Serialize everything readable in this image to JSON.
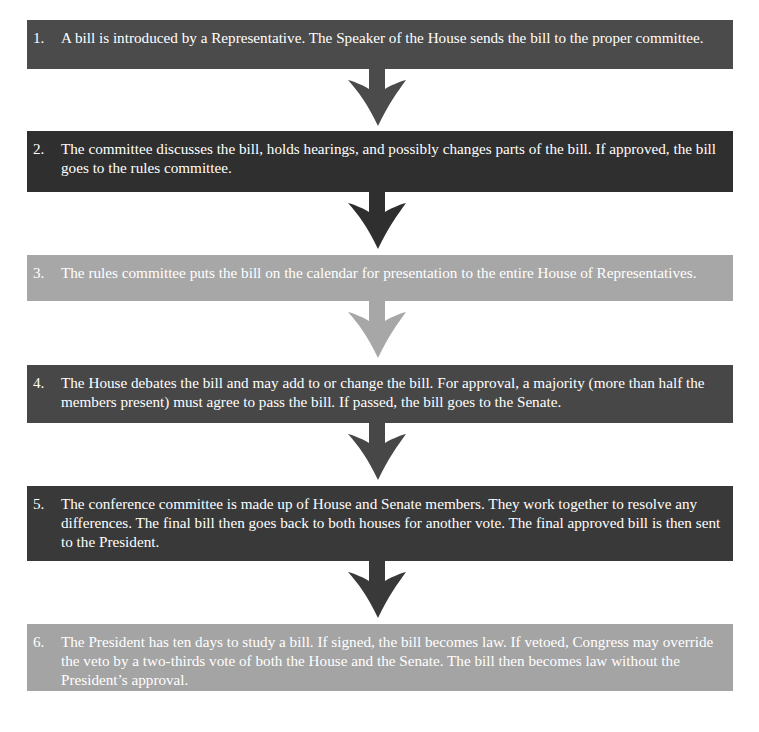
{
  "diagram": {
    "steps": [
      {
        "number": "1.",
        "text": "A bill is introduced by a Representative. The Speaker of the House sends the bill to the proper committee.",
        "color": "#4b4b4b"
      },
      {
        "number": "2.",
        "text": "The committee discusses the bill, holds hearings, and possibly changes parts of the bill. If approved, the bill goes to the rules committee.",
        "color": "#2f2f2f"
      },
      {
        "number": "3.",
        "text": "The rules committee puts the bill on the calendar for presentation to the entire House of Representatives.",
        "color": "#a7a7a7"
      },
      {
        "number": "4.",
        "text": "The House debates the bill and may add to or change the bill. For approval, a majority (more than half the members present) must agree to pass the bill. If passed, the bill goes to the Senate.",
        "color": "#474747"
      },
      {
        "number": "5.",
        "text": "The conference committee is made up of House and Senate members. They work together to resolve any differences. The final bill then goes back to both houses for another vote. The final approved bill is then sent to the President.",
        "color": "#393939"
      },
      {
        "number": "6.",
        "text": "The President has ten days to study a bill. If signed, the bill becomes law. If vetoed, Congress may override the veto by a two-thirds vote of both the House and the Senate. The bill then becomes law without the President’s approval.",
        "color": "#a4a4a4"
      }
    ],
    "arrows": [
      {
        "icon": "down-arrow-icon",
        "color": "#4b4b4b"
      },
      {
        "icon": "down-arrow-icon",
        "color": "#2f2f2f"
      },
      {
        "icon": "down-arrow-icon",
        "color": "#a7a7a7"
      },
      {
        "icon": "down-arrow-icon",
        "color": "#474747"
      },
      {
        "icon": "down-arrow-icon",
        "color": "#393939"
      }
    ]
  }
}
